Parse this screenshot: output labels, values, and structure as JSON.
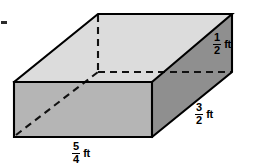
{
  "figure": {
    "name": "rectangular-prism-with-dimensions",
    "shape": "rectangular prism",
    "background_color": "#ffffff",
    "faces": {
      "top": {
        "name": "top-face",
        "fill": "#dcdcdc",
        "points": "14,82 98,14 232,14 152,82"
      },
      "front": {
        "name": "front-face",
        "fill": "#b5b5b5",
        "points": "14,82 152,82 152,137 14,137"
      },
      "right": {
        "name": "right-face",
        "fill": "#8f8f8f",
        "points": "152,82 232,14 232,72 152,137"
      }
    },
    "edges": {
      "stroke": "#000000",
      "stroke_width": 2.0,
      "visible": [
        "14,82 98,14",
        "98,14 232,14",
        "232,14 232,72",
        "232,72 152,137",
        "152,137 14,137",
        "14,137 14,82",
        "14,82 152,82",
        "152,82 232,14",
        "152,82 152,137"
      ],
      "hidden_dashed": [
        "98,14 98,72",
        "98,72 232,72",
        "16,135 98,72"
      ],
      "dash_pattern": "7,5"
    },
    "artifact_dash": {
      "name": "cropped-edge-dash",
      "x": 1,
      "y": 21,
      "width": 6,
      "height": 3,
      "fill": "#2b2b2b"
    }
  },
  "labels": {
    "height": {
      "name": "height-dimension-label",
      "numerator": "1",
      "denominator": "2",
      "unit": "ft",
      "value": "1/2 ft"
    },
    "depth": {
      "name": "depth-dimension-label",
      "numerator": "3",
      "denominator": "2",
      "unit": "ft",
      "value": "3/2 ft"
    },
    "width": {
      "name": "width-dimension-label",
      "numerator": "5",
      "denominator": "4",
      "unit": "ft",
      "value": "5/4 ft"
    }
  }
}
